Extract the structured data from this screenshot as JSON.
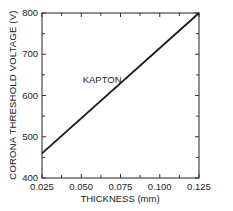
{
  "chart_data": {
    "type": "line",
    "title": "",
    "xlabel": "THICKNESS (mm)",
    "ylabel": "CORONA THRESHOLD VOLTAGE (V)",
    "xlim": [
      0.025,
      0.125
    ],
    "ylim": [
      400,
      800
    ],
    "x_ticks": [
      "0.025",
      "0.050",
      "0.075",
      "0.100",
      "0.125"
    ],
    "y_ticks": [
      "400",
      "500",
      "600",
      "700",
      "800"
    ],
    "grid": false,
    "legend": null,
    "series": [
      {
        "name": "KAPTON",
        "color": "#1a1a1a",
        "x": [
          0.025,
          0.125
        ],
        "y": [
          460,
          800
        ]
      }
    ],
    "annotations": [
      {
        "text": "KAPTON",
        "x": 0.07,
        "y": 640
      }
    ]
  },
  "axes": {
    "x_title": "THICKNESS (mm)",
    "y_title": "CORONA THRESHOLD VOLTAGE (V)"
  },
  "colors": {
    "line": "#1a1a1a",
    "axis": "#333333",
    "background": "#ffffff"
  }
}
